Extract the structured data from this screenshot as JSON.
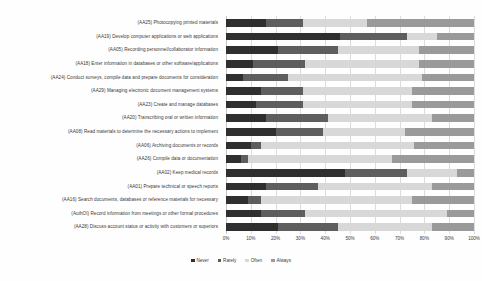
{
  "chart_data": {
    "type": "bar",
    "subtype": "stacked-horizontal-100-percent",
    "title": "",
    "xlabel": "",
    "ylabel": "",
    "xlim": [
      0,
      100
    ],
    "grid": true,
    "legend_position": "bottom",
    "xticks": [
      "0%",
      "10%",
      "20%",
      "30%",
      "40%",
      "50%",
      "60%",
      "70%",
      "80%",
      "90%",
      "100%"
    ],
    "xtick_values": [
      0,
      10,
      20,
      30,
      40,
      50,
      60,
      70,
      80,
      90,
      100
    ],
    "legend": [
      "Never",
      "Rarely",
      "Often",
      "Always"
    ],
    "colors": {
      "Never": "#2f2f2f",
      "Rarely": "#5e5e5e",
      "Often": "#d8d8d8",
      "Always": "#9a9a9a"
    },
    "categories": [
      "(AA25) Photocopying printed materials",
      "(AA19) Develop computer applications or web applications",
      "(AA05) Recording personnel/collaborator information",
      "(AA18) Enter information in databases or other software/applications",
      "(AA24) Conduct surveys, compile data and prepare documents for consideration",
      "(AA29) Managing electronic document management systems",
      "(AA23) Create and manage databases",
      "(AA20) Transcribing oral or written information",
      "(AA08) Read materials to determine the necessary actions to implement",
      "(AA06) Archiving documents or records",
      "(AA26) Compile data or documentation",
      "(AA02) Keep medical records",
      "(AA01) Prepare technical or speech reports",
      "(AA16) Search documents, databases or reference materials for necessary",
      "(AuthOI) Record information from meetings or other formal procedures",
      "(AA28) Discuss account status or activity with customers or superiors"
    ],
    "series": [
      {
        "name": "Never",
        "values": [
          16,
          46,
          21,
          11,
          7,
          14,
          12,
          16,
          20,
          10,
          6,
          48,
          16,
          9,
          14,
          21
        ]
      },
      {
        "name": "Rarely",
        "values": [
          15,
          27,
          24,
          21,
          18,
          17,
          19,
          25,
          19,
          4,
          3,
          25,
          21,
          5,
          18,
          24
        ]
      },
      {
        "name": "Often",
        "values": [
          26,
          12,
          33,
          46,
          54,
          44,
          44,
          42,
          33,
          62,
          58,
          20,
          46,
          61,
          57,
          38
        ]
      },
      {
        "name": "Always",
        "values": [
          43,
          15,
          22,
          22,
          21,
          25,
          25,
          17,
          28,
          24,
          33,
          7,
          17,
          25,
          11,
          17
        ]
      }
    ],
    "rows": [
      {
        "label": "(AA25) Photocopying printed materials",
        "segments": [
          16,
          15,
          26,
          43
        ]
      },
      {
        "label": "(AA19) Develop computer applications or web applications",
        "segments": [
          46,
          27,
          12,
          15
        ]
      },
      {
        "label": "(AA05) Recording personnel/collaborator information",
        "segments": [
          21,
          24,
          33,
          22
        ]
      },
      {
        "label": "(AA18) Enter information in databases or other software/applications",
        "segments": [
          11,
          21,
          46,
          22
        ]
      },
      {
        "label": "(AA24) Conduct surveys, compile data and prepare documents for consideration",
        "segments": [
          7,
          18,
          54,
          21
        ]
      },
      {
        "label": "(AA29) Managing electronic document management systems",
        "segments": [
          14,
          17,
          44,
          25
        ]
      },
      {
        "label": "(AA23) Create and manage databases",
        "segments": [
          12,
          19,
          44,
          25
        ]
      },
      {
        "label": "(AA20) Transcribing oral or written information",
        "segments": [
          16,
          25,
          42,
          17
        ]
      },
      {
        "label": "(AA08) Read materials to determine the necessary actions to implement",
        "segments": [
          20,
          19,
          33,
          28
        ]
      },
      {
        "label": "(AA06) Archiving documents or records",
        "segments": [
          10,
          4,
          62,
          24
        ]
      },
      {
        "label": "(AA26) Compile data or documentation",
        "segments": [
          6,
          3,
          58,
          33
        ]
      },
      {
        "label": "(AA02) Keep medical records",
        "segments": [
          48,
          25,
          20,
          7
        ]
      },
      {
        "label": "(AA01) Prepare technical or speech reports",
        "segments": [
          16,
          21,
          46,
          17
        ]
      },
      {
        "label": "(AA16) Search documents, databases or reference materials for necessary",
        "segments": [
          9,
          5,
          61,
          25
        ]
      },
      {
        "label": "(AuthOI) Record information from meetings or other formal procedures",
        "segments": [
          14,
          18,
          57,
          11
        ]
      },
      {
        "label": "(AA28) Discuss account status or activity with customers or superiors",
        "segments": [
          21,
          24,
          38,
          17
        ]
      }
    ]
  }
}
